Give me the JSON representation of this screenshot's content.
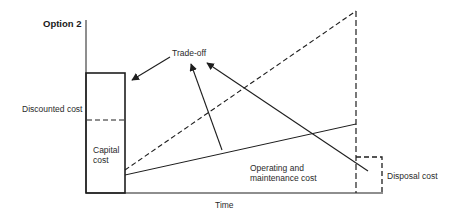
{
  "diagram": {
    "title": "Option  2",
    "y_axis_label": "Discounted cost",
    "x_axis_label": "Time",
    "labels": {
      "trade_off": "Trade-off",
      "capital_cost_line1": "Capital",
      "capital_cost_line2": "cost",
      "om_cost_line1": "Operating and",
      "om_cost_line2": "maintenance cost",
      "disposal_cost": "Disposal cost"
    },
    "elements": [
      {
        "id": "capital-cost-box",
        "type": "solid-rect",
        "desc": "Capital cost block at start of time axis"
      },
      {
        "id": "capital-discount-line",
        "type": "dashed-line",
        "desc": "Dashed level inside capital block"
      },
      {
        "id": "om-cost-line",
        "type": "solid-line",
        "desc": "Operating and maintenance cost rising gently over time"
      },
      {
        "id": "cumulative-dashed-line",
        "type": "dashed-line",
        "desc": "Steep dashed cumulative cost line"
      },
      {
        "id": "end-of-life-line",
        "type": "dashed-line",
        "desc": "Vertical dashed line at end of life"
      },
      {
        "id": "disposal-cost-box",
        "type": "dashed-rect",
        "desc": "Disposal cost block at end"
      },
      {
        "id": "trade-off-arrows",
        "type": "arrows",
        "desc": "Three arrows converging on Trade-off label from capital, O&M and disposal"
      }
    ],
    "colors": {
      "stroke": "#1e1e1e",
      "background": "#ffffff"
    }
  }
}
